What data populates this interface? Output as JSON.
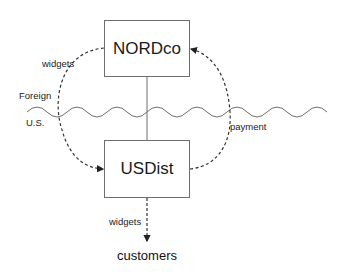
{
  "nodes": {
    "nordco": "NORDco",
    "usdist": "USDist",
    "customers": "customers"
  },
  "regions": {
    "foreign": "Foreign",
    "us": "U.S."
  },
  "flows": {
    "widgets_to_usdist": "widgets",
    "payment_to_nordco": "payment",
    "widgets_to_customers": "widgets"
  },
  "colors": {
    "line": "#6e6e6e",
    "dashed": "#333333",
    "text": "#1a1a1a"
  }
}
